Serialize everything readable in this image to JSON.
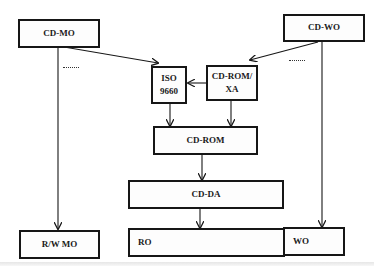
{
  "diagram": {
    "type": "block-diagram",
    "nodes": {
      "cd_mo": {
        "label": "CD-MO"
      },
      "cd_wo": {
        "label": "CD-WO"
      },
      "iso9660": {
        "label": "ISO\n9660"
      },
      "cd_rom_xa": {
        "label": "CD-ROM/\nXA"
      },
      "cd_rom": {
        "label": "CD-ROM"
      },
      "cd_da": {
        "label": "CD-DA"
      },
      "rw_mo": {
        "label": "R/W MO"
      },
      "ro": {
        "label": "RO"
      },
      "wo": {
        "label": "WO"
      }
    },
    "edges": [
      {
        "from": "CD-MO",
        "to": "ISO 9660 / CD-ROM/XA",
        "style": "arrow"
      },
      {
        "from": "CD-MO",
        "to": "R/W MO",
        "style": "arrow"
      },
      {
        "from": "CD-WO",
        "to": "CD-ROM/XA",
        "style": "arrow"
      },
      {
        "from": "CD-WO",
        "to": "WO",
        "style": "arrow"
      },
      {
        "from": "CD-ROM/XA",
        "to": "ISO 9660",
        "style": "arrow"
      },
      {
        "from": "ISO 9660",
        "to": "CD-ROM",
        "style": "arrow"
      },
      {
        "from": "CD-ROM/XA",
        "to": "CD-ROM",
        "style": "arrow"
      },
      {
        "from": "CD-ROM",
        "to": "CD-DA",
        "style": "arrow"
      },
      {
        "from": "CD-DA",
        "to": "RO",
        "style": "arrow"
      }
    ],
    "annotations": {
      "left_dots": "........",
      "right_dots": "........"
    },
    "colors": {
      "line": "#161616",
      "background": "#ffffff"
    }
  }
}
